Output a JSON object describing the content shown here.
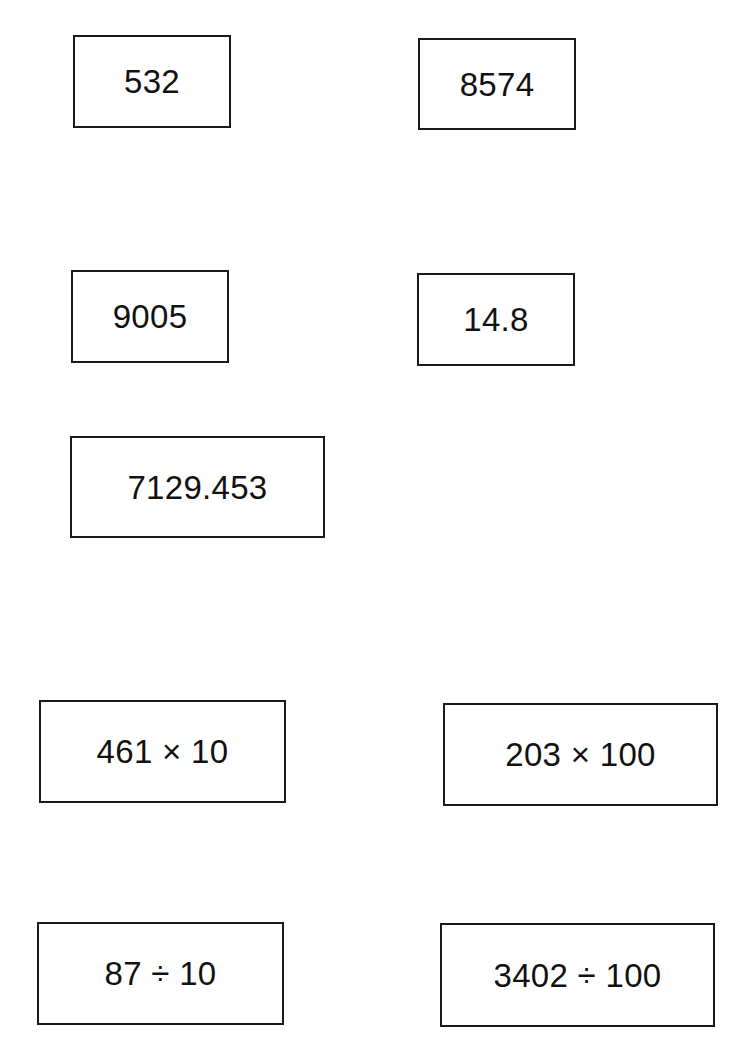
{
  "cards": [
    {
      "label": "532"
    },
    {
      "label": "8574"
    },
    {
      "label": "9005"
    },
    {
      "label": "14.8"
    },
    {
      "label": "7129.453"
    },
    {
      "label": "461 × 10"
    },
    {
      "label": "203 × 100"
    },
    {
      "label": "87 ÷ 10"
    },
    {
      "label": "3402 ÷ 100"
    }
  ]
}
